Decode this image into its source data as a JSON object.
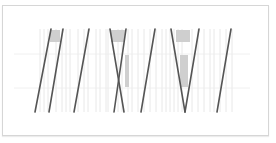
{
  "chart_data": {
    "type": "line",
    "title": "",
    "xlabel": "",
    "ylabel": "",
    "grid": true,
    "legend": null,
    "plot_area": {
      "x0": 40,
      "x1": 232,
      "y0": 29,
      "y1": 112
    },
    "h_gridlines_y": [
      54,
      88
    ],
    "v_gridlines_x": [
      40,
      44,
      48,
      56,
      62,
      66,
      70,
      78,
      84,
      88,
      96,
      100,
      106,
      108,
      118,
      122,
      128,
      132,
      138,
      144,
      150,
      156,
      162,
      166,
      170,
      174,
      178,
      182,
      192,
      198,
      204,
      210,
      214,
      220,
      226,
      232
    ],
    "series": [
      {
        "name": "line-1",
        "points": [
          [
            35,
            112
          ],
          [
            51,
            29
          ]
        ]
      },
      {
        "name": "line-2",
        "points": [
          [
            49,
            112
          ],
          [
            63,
            29
          ]
        ]
      },
      {
        "name": "line-3",
        "points": [
          [
            74,
            112
          ],
          [
            89,
            29
          ]
        ]
      },
      {
        "name": "line-4a",
        "points": [
          [
            110,
            29
          ],
          [
            124,
            112
          ]
        ]
      },
      {
        "name": "line-4b",
        "points": [
          [
            126,
            29
          ],
          [
            114,
            112
          ]
        ]
      },
      {
        "name": "line-5",
        "points": [
          [
            141,
            112
          ],
          [
            155,
            29
          ]
        ]
      },
      {
        "name": "line-6a",
        "points": [
          [
            171,
            29
          ],
          [
            185,
            112
          ]
        ]
      },
      {
        "name": "line-6b",
        "points": [
          [
            185,
            112
          ],
          [
            199,
            29
          ]
        ]
      },
      {
        "name": "line-7",
        "points": [
          [
            217,
            112
          ],
          [
            231,
            29
          ]
        ]
      }
    ],
    "shaded_regions": [
      {
        "x": 50,
        "y": 30,
        "w": 10,
        "h": 12
      },
      {
        "x": 111,
        "y": 30,
        "w": 14,
        "h": 12
      },
      {
        "x": 125,
        "y": 55,
        "w": 4,
        "h": 32
      },
      {
        "x": 176,
        "y": 30,
        "w": 14,
        "h": 12
      },
      {
        "x": 180,
        "y": 55,
        "w": 8,
        "h": 32
      }
    ],
    "colors": {
      "line": "#555555",
      "grid_vertical": "#e2e2e2",
      "grid_horizontal": "#ececec",
      "shade": "#cfcfcf",
      "frame": "#d6d6d6"
    }
  }
}
